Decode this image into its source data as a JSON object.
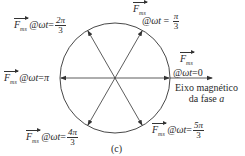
{
  "diagram": {
    "circle": {
      "cx": 115,
      "cy": 78,
      "r": 55,
      "stroke": "#333333"
    },
    "vectors": [
      {
        "id": "wt-0",
        "angle_deg": 0
      },
      {
        "id": "wt-pi-3",
        "angle_deg": 60
      },
      {
        "id": "wt-2pi-3",
        "angle_deg": 120
      },
      {
        "id": "wt-pi",
        "angle_deg": 180
      },
      {
        "id": "wt-4pi-3",
        "angle_deg": 240
      },
      {
        "id": "wt-5pi-3",
        "angle_deg": 300
      }
    ],
    "labels": {
      "vector_symbol": "F",
      "vector_subscript": "ms",
      "at_wt": "@ωt",
      "equals": "=",
      "wt_0": {
        "value": "0"
      },
      "wt_pi_3": {
        "num": "π",
        "den": "3"
      },
      "wt_2pi_3": {
        "num": "2π",
        "den": "3"
      },
      "wt_pi": {
        "value": "π"
      },
      "wt_4pi_3": {
        "num": "4π",
        "den": "3"
      },
      "wt_5pi_3": {
        "num": "5π",
        "den": "3"
      }
    },
    "axis_label_line1": "Eixo magnético",
    "axis_label_line2_prefix": "da fase ",
    "axis_label_phase": "a",
    "caption": "(c)"
  }
}
